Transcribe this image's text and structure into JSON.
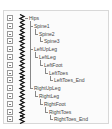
{
  "hierarchy": {
    "nodes": [
      {
        "label": "Hips",
        "depth": 0
      },
      {
        "label": "Spine1",
        "depth": 1
      },
      {
        "label": "Spine2",
        "depth": 2
      },
      {
        "label": "Spine3",
        "depth": 3
      },
      {
        "label": "LeftUpLeg",
        "depth": 1
      },
      {
        "label": "LeftLeg",
        "depth": 2
      },
      {
        "label": "LeftFoot",
        "depth": 3
      },
      {
        "label": "LeftToes",
        "depth": 4
      },
      {
        "label": "LeftToes_End",
        "depth": 5
      },
      {
        "label": "RightUpLeg",
        "depth": 1
      },
      {
        "label": "RightLeg",
        "depth": 2
      },
      {
        "label": "RightFoot",
        "depth": 3
      },
      {
        "label": "RightToes",
        "depth": 4
      },
      {
        "label": "RightToes_End",
        "depth": 5
      }
    ]
  },
  "icons": {
    "row_toggle": "collapse-box-icon",
    "node": "bone-zigzag-icon"
  }
}
